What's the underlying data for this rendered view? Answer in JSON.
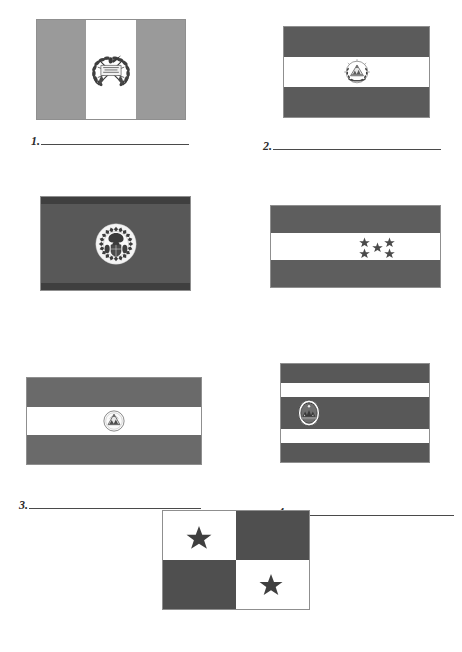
{
  "worksheet": {
    "title": "Central American Flags Identification Worksheet",
    "page_background": "#ffffff",
    "line_color": "#4a4a4a",
    "palette": {
      "light_gray": "#9a9a9a",
      "mid_gray": "#6e6e6e",
      "dark_gray": "#4f4f4f",
      "darker_gray": "#3f3f3f",
      "white": "#ffffff",
      "emblem_ink": "#3a3a3a",
      "border": "#8f8f8f"
    }
  },
  "items": [
    {
      "number": "1.",
      "flag_name": "guatemala-flag",
      "answer_value": "",
      "description": "Three vertical bands, light gray - white - light gray, with coat of arms emblem centered",
      "bands": [
        {
          "orientation": "vertical",
          "color": "#9a9a9a",
          "start_pct": 0,
          "size_pct": 33.4
        },
        {
          "orientation": "vertical",
          "color": "#ffffff",
          "start_pct": 33.4,
          "size_pct": 33.2
        },
        {
          "orientation": "vertical",
          "color": "#9a9a9a",
          "start_pct": 66.6,
          "size_pct": 33.4
        }
      ],
      "emblem": "wreath-quetzal-emblem",
      "stars": 0
    },
    {
      "number": "2.",
      "flag_name": "el-salvador-flag",
      "answer_value": "",
      "description": "Three horizontal bands, dark gray - white - dark gray, with round coat of arms centered",
      "bands": [
        {
          "orientation": "horizontal",
          "color": "#5b5b5b",
          "start_pct": 0,
          "size_pct": 33.4
        },
        {
          "orientation": "horizontal",
          "color": "#ffffff",
          "start_pct": 33.4,
          "size_pct": 33.2
        },
        {
          "orientation": "horizontal",
          "color": "#5b5b5b",
          "start_pct": 66.6,
          "size_pct": 33.4
        }
      ],
      "emblem": "triangle-wreath-seal-emblem",
      "stars": 0
    },
    {
      "number": "3.",
      "flag_name": "belize-flag",
      "answer_value": "",
      "description": "Solid dark field with thin darker bands top and bottom, white circular seal centered",
      "bands": [
        {
          "orientation": "horizontal",
          "color": "#3f3f3f",
          "start_pct": 0,
          "size_pct": 8
        },
        {
          "orientation": "horizontal",
          "color": "#585858",
          "start_pct": 8,
          "size_pct": 84
        },
        {
          "orientation": "horizontal",
          "color": "#3f3f3f",
          "start_pct": 92,
          "size_pct": 8
        }
      ],
      "emblem": "circular-mahogany-seal-emblem",
      "stars": 0
    },
    {
      "number": "4.",
      "flag_name": "honduras-flag",
      "answer_value": "",
      "description": "Three horizontal bands, gray - white - gray, with five stars in an X pattern on the white band",
      "bands": [
        {
          "orientation": "horizontal",
          "color": "#5e5e5e",
          "start_pct": 0,
          "size_pct": 33.4
        },
        {
          "orientation": "horizontal",
          "color": "#ffffff",
          "start_pct": 33.4,
          "size_pct": 33.2
        },
        {
          "orientation": "horizontal",
          "color": "#5e5e5e",
          "start_pct": 66.6,
          "size_pct": 33.4
        }
      ],
      "emblem": "",
      "stars": 5,
      "star_layout": "x-pattern"
    },
    {
      "number": "5.",
      "flag_name": "nicaragua-flag",
      "answer_value": "",
      "description": "Three horizontal bands, gray - white - gray, with small triangle seal centered",
      "bands": [
        {
          "orientation": "horizontal",
          "color": "#6a6a6a",
          "start_pct": 0,
          "size_pct": 33.4
        },
        {
          "orientation": "horizontal",
          "color": "#ffffff",
          "start_pct": 33.4,
          "size_pct": 33.2
        },
        {
          "orientation": "horizontal",
          "color": "#6a6a6a",
          "start_pct": 66.6,
          "size_pct": 33.4
        }
      ],
      "emblem": "triangle-volcano-seal-emblem",
      "stars": 0
    },
    {
      "number": "6.",
      "flag_name": "costa-rica-flag",
      "answer_value": "",
      "description": "Five horizontal bands, gray - white - wide gray - white - gray, with oval seal on the left of the center band",
      "bands": [
        {
          "orientation": "horizontal",
          "color": "#585858",
          "start_pct": 0,
          "size_pct": 19
        },
        {
          "orientation": "horizontal",
          "color": "#ffffff",
          "start_pct": 19,
          "size_pct": 15
        },
        {
          "orientation": "horizontal",
          "color": "#585858",
          "start_pct": 34,
          "size_pct": 32
        },
        {
          "orientation": "horizontal",
          "color": "#ffffff",
          "start_pct": 66,
          "size_pct": 15
        },
        {
          "orientation": "horizontal",
          "color": "#585858",
          "start_pct": 81,
          "size_pct": 19
        }
      ],
      "emblem": "oval-coat-of-arms-emblem",
      "stars": 0
    },
    {
      "number": "7.",
      "flag_name": "panama-flag",
      "answer_value": "",
      "description": "Four quadrants: white with dark star upper-left, solid dark upper-right, solid dark lower-left, white with dark star lower-right",
      "quadrants": [
        {
          "position": "upper-left",
          "color": "#ffffff",
          "star": true
        },
        {
          "position": "upper-right",
          "color": "#4f4f4f",
          "star": false
        },
        {
          "position": "lower-left",
          "color": "#4f4f4f",
          "star": false
        },
        {
          "position": "lower-right",
          "color": "#ffffff",
          "star": true
        }
      ],
      "emblem": "",
      "stars": 2,
      "star_layout": "diagonal-quadrants"
    }
  ]
}
